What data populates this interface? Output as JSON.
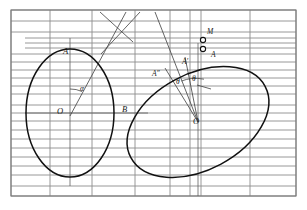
{
  "figure": {
    "type": "geometry-diagram",
    "canvas": {
      "width": 307,
      "height": 210
    },
    "colors": {
      "background": "#ffffff",
      "grid_line": "#8d8d8d",
      "frame_line": "#7a7a7a",
      "curve": "#111111",
      "construction_line": "#4a4a4a",
      "label_text": "#1a1a1a"
    },
    "frame": {
      "x": 11,
      "y": 10,
      "width": 285,
      "height": 186
    },
    "grid": {
      "horizontal_y": [
        10,
        21,
        32,
        38,
        43,
        48,
        54,
        62,
        70,
        78,
        86,
        94,
        105,
        113,
        121,
        130,
        139,
        148,
        157,
        166,
        175,
        186,
        196
      ],
      "vertical_x": [
        11,
        50,
        92,
        135,
        170,
        190,
        201,
        250,
        296
      ],
      "partial_horizontal": [
        {
          "y": 38,
          "x1": 25,
          "x2": 296
        },
        {
          "y": 43,
          "x1": 25,
          "x2": 296
        },
        {
          "y": 48,
          "x1": 25,
          "x2": 296
        }
      ]
    },
    "ellipses": [
      {
        "name": "left-ellipse",
        "cx": 70,
        "cy": 113,
        "rx": 44,
        "ry": 64,
        "rotation_deg": 0,
        "center_label": "O"
      },
      {
        "name": "right-ellipse",
        "cx": 198,
        "cy": 122,
        "rx": 76,
        "ry": 48,
        "rotation_deg": -28,
        "center_label": "O"
      }
    ],
    "points": [
      {
        "id": "A-left",
        "label": "A",
        "x": 69,
        "y": 48,
        "label_x": 64,
        "label_y": 52
      },
      {
        "id": "O-left",
        "label": "O",
        "x": 70,
        "y": 113,
        "label_x": 58,
        "label_y": 113
      },
      {
        "id": "B-left",
        "label": "B",
        "x": 125,
        "y": 113,
        "label_x": 124,
        "label_y": 111
      },
      {
        "id": "alpha",
        "label": "α",
        "x": 83,
        "y": 90,
        "label_x": 82,
        "label_y": 90
      },
      {
        "id": "A-dprime",
        "label": "A″",
        "x": 163,
        "y": 74,
        "label_x": 153,
        "label_y": 76
      },
      {
        "id": "A-prime",
        "label": "A′",
        "x": 190,
        "y": 62,
        "label_x": 183,
        "label_y": 64
      },
      {
        "id": "A-right",
        "label": "A",
        "x": 217,
        "y": 60,
        "label_x": 213,
        "label_y": 60
      },
      {
        "id": "O-right",
        "label": "O",
        "x": 198,
        "y": 122,
        "label_x": 194,
        "label_y": 122
      },
      {
        "id": "M",
        "label": "M",
        "x": 204,
        "y": 32,
        "label_x": 208,
        "label_y": 31
      },
      {
        "id": "theta-1",
        "label": "θ",
        "x": 180,
        "y": 82,
        "label_x": 178,
        "label_y": 82
      },
      {
        "id": "theta-2",
        "label": "θ",
        "x": 196,
        "y": 80,
        "label_x": 194,
        "label_y": 80
      }
    ],
    "markers": [
      {
        "id": "marker-M",
        "cx": 203,
        "cy": 40,
        "r": 2.6,
        "style": "open-circle"
      },
      {
        "id": "marker-A",
        "cx": 203,
        "cy": 49,
        "r": 2.6,
        "style": "open-circle"
      }
    ],
    "construction_lines": [
      {
        "id": "left-vertical-axis",
        "x1": 70,
        "y1": 38,
        "x2": 70,
        "y2": 186
      },
      {
        "id": "left-horizontal-axis",
        "x1": 25,
        "y1": 113,
        "x2": 145,
        "y2": 113
      },
      {
        "id": "left-OA-slant",
        "x1": 70,
        "y1": 116,
        "x2": 124,
        "y2": 13
      },
      {
        "id": "top-cross-a",
        "x1": 100,
        "y1": 12,
        "x2": 132,
        "y2": 40
      },
      {
        "id": "top-cross-b",
        "x1": 139,
        "y1": 12,
        "x2": 103,
        "y2": 52
      },
      {
        "id": "right-OA-long",
        "x1": 198,
        "y1": 122,
        "x2": 155,
        "y2": 12
      },
      {
        "id": "right-OAprime",
        "x1": 198,
        "y1": 122,
        "x2": 166,
        "y2": 70
      },
      {
        "id": "right-OAdouble",
        "x1": 198,
        "y1": 122,
        "x2": 184,
        "y2": 58
      },
      {
        "id": "right-vertical-axis",
        "x1": 198,
        "y1": 43,
        "x2": 198,
        "y2": 196
      },
      {
        "id": "theta-pointer",
        "x1": 196,
        "y1": 84,
        "x2": 210,
        "y2": 88
      }
    ],
    "angle_arcs": [
      {
        "id": "arc-alpha",
        "cx": 70,
        "cy": 116,
        "r": 27,
        "start_deg": -90,
        "end_deg": -63
      },
      {
        "id": "arc-theta-1",
        "cx": 198,
        "cy": 122,
        "r": 44,
        "start_deg": -112,
        "end_deg": -98
      },
      {
        "id": "arc-theta-2",
        "cx": 198,
        "cy": 122,
        "r": 44,
        "start_deg": -98,
        "end_deg": -80
      }
    ]
  }
}
